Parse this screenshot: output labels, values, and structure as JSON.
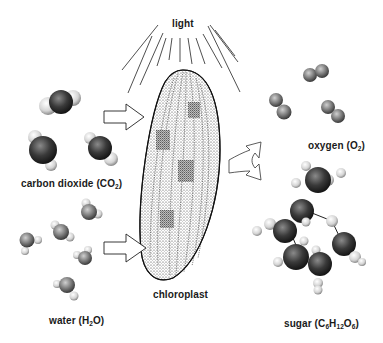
{
  "diagram": {
    "labels": {
      "light": "light",
      "chloroplast": "chloroplast",
      "carbon_dioxide": {
        "name": "carbon dioxide (CO",
        "sub": "2",
        "close": ")"
      },
      "water": {
        "name": "water (H",
        "sub": "2",
        "rest": "O)"
      },
      "oxygen": {
        "name": "oxygen (O",
        "sub": "2",
        "close": ")"
      },
      "sugar": {
        "prefix": "sugar (C",
        "s1": "6",
        "mid1": "H",
        "s2": "12",
        "mid2": "O",
        "s3": "6",
        "close": ")"
      }
    },
    "inputs": [
      "carbon dioxide",
      "water",
      "light"
    ],
    "outputs": [
      "oxygen",
      "sugar"
    ],
    "colors": {
      "ink": "#1a1a1a",
      "background": "#ffffff",
      "dark_atom": "#2a2a2a",
      "light_atom": "#d8d8d8"
    }
  }
}
